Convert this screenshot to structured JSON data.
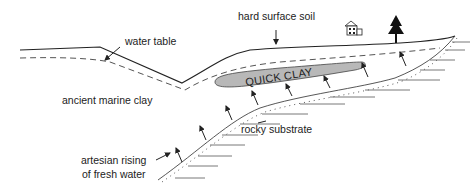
{
  "diagram": {
    "title": "",
    "labels": {
      "water_table": "water table",
      "hard_surface_soil": "hard surface soil",
      "quick_clay": "QUICK CLAY",
      "ancient_marine_clay": "ancient marine clay",
      "rocky_substrate": "rocky substrate",
      "artesian_line1": "artesian rising",
      "artesian_line2": "of fresh water"
    },
    "icons": [
      "house-icon",
      "tree-icon",
      "arrow-icon"
    ],
    "colors": {
      "line": "#222222",
      "quick_clay_fill": "#b8b8b8",
      "water_table": "#555555"
    }
  }
}
